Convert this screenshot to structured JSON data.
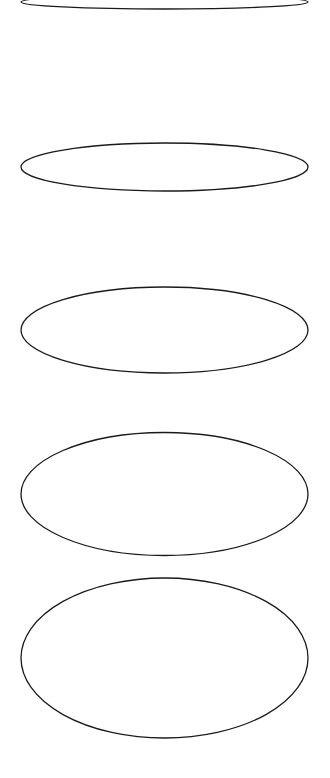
{
  "canvas": {
    "width": 330,
    "height": 778,
    "background": "#ffffff"
  },
  "stroke": {
    "color": "#1a1a1a",
    "width": 1.3
  },
  "ellipses": [
    {
      "id": "ellipse-1",
      "cx": 164.5,
      "cy": 2,
      "rx": 143.5,
      "ry": 7
    },
    {
      "id": "ellipse-2",
      "cx": 164.5,
      "cy": 167,
      "rx": 143.5,
      "ry": 24
    },
    {
      "id": "ellipse-3",
      "cx": 164.5,
      "cy": 330,
      "rx": 143.5,
      "ry": 43
    },
    {
      "id": "ellipse-4",
      "cx": 164.5,
      "cy": 494,
      "rx": 143.5,
      "ry": 61.5
    },
    {
      "id": "ellipse-5",
      "cx": 164.5,
      "cy": 658,
      "rx": 143.5,
      "ry": 80
    }
  ]
}
